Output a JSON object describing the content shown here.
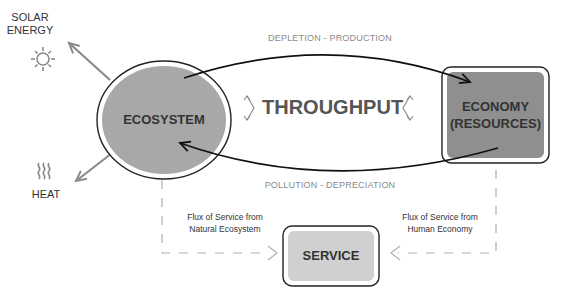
{
  "external": {
    "solar_label": "SOLAR\nENERGY",
    "solar_line1": "SOLAR",
    "solar_line2": "ENERGY",
    "solar_icon": "sun-icon",
    "heat_label": "HEAT",
    "heat_icon": "heat-waves-icon"
  },
  "nodes": {
    "ecosystem": "ECOSYSTEM",
    "economy_line1": "ECONOMY",
    "economy_line2": "(RESOURCES)",
    "service": "SERVICE"
  },
  "flows": {
    "top": "DEPLETION - PRODUCTION",
    "bottom": "POLLUTION - DEPRECIATION",
    "center": "THROUGHPUT"
  },
  "flux": {
    "left_line1": "Flux of Service from",
    "left_line2": "Natural Ecosystem",
    "right_line1": "Flux of Service from",
    "right_line2": "Human Economy"
  },
  "colors": {
    "ecosystem_fill": "#a8a8a8",
    "economy_fill": "#8f8f8f",
    "service_fill": "#d0d0d0",
    "outline": "#222222",
    "gray_arrow": "#8a8a8a",
    "dashed": "#b0b0b0"
  }
}
